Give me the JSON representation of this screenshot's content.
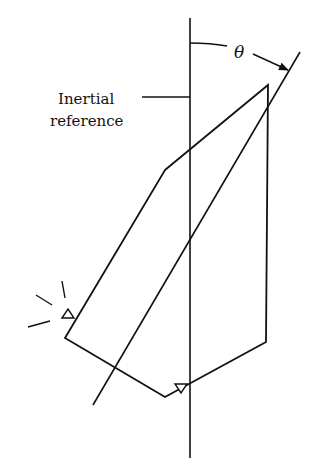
{
  "diagram": {
    "type": "mechanics-schematic",
    "labels": {
      "reference_line1": "Inertial",
      "reference_line2": "reference",
      "angle": "θ"
    },
    "colors": {
      "stroke": "#111111",
      "background": "#ffffff"
    },
    "elements": {
      "inertial_reference_line": {
        "x": 190,
        "y1": 18,
        "y2": 458
      },
      "body_axis": {
        "x1": 93,
        "y1": 405,
        "x2": 300,
        "y2": 52
      },
      "body_outline": [
        [
          165,
          170
        ],
        [
          268,
          85
        ],
        [
          266,
          342
        ],
        [
          165,
          397
        ],
        [
          65,
          338
        ]
      ],
      "sensors": [
        {
          "name": "left-sensor",
          "x": 67,
          "y": 313,
          "orientation": "up"
        },
        {
          "name": "bottom-sensor",
          "x": 181,
          "y": 388,
          "orientation": "down"
        }
      ],
      "light_source_rays": 3
    }
  }
}
